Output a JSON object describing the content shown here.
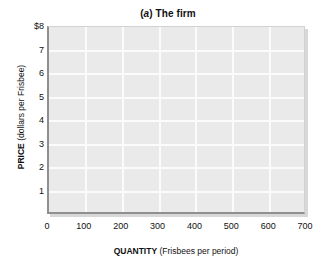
{
  "chart_data": {
    "type": "line",
    "title": "(a) The firm",
    "title_panel_letter": "a",
    "title_text": ") The firm",
    "title_prefix": "(",
    "xlabel_strong": "QUANTITY",
    "xlabel_unit": " (Frisbees per period)",
    "ylabel_strong": "PRICE",
    "ylabel_unit": " (dollars per Frisbee)",
    "xlabel": "QUANTITY (Frisbees per period)",
    "ylabel": "PRICE (dollars per Frisbee)",
    "x": [],
    "values": [],
    "series": [],
    "xticks": [
      "0",
      "100",
      "200",
      "300",
      "400",
      "500",
      "600",
      "700"
    ],
    "xtick_values": [
      0,
      100,
      200,
      300,
      400,
      500,
      600,
      700
    ],
    "yticks": [
      "1",
      "2",
      "3",
      "4",
      "5",
      "6",
      "7",
      "$8"
    ],
    "ytick_values": [
      1,
      2,
      3,
      4,
      5,
      6,
      7,
      8
    ],
    "xlim": [
      0,
      700
    ],
    "ylim": [
      0,
      8
    ],
    "grid": true,
    "legend": null,
    "legend_position": "none",
    "annotations": [],
    "plot_background_color": "#eaeaea",
    "gridline_color": "#fbfbfb",
    "axis_color": "#8f8f8f",
    "page_background_color": "#ffffff"
  }
}
